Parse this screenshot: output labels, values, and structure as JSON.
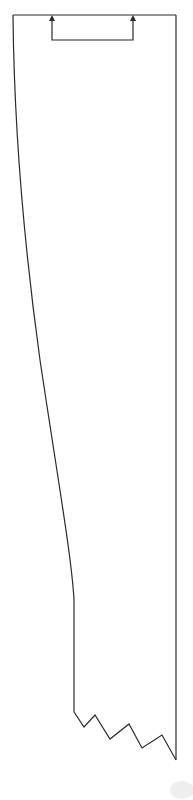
{
  "diagram": {
    "colors": {
      "line": "#2a2a2a",
      "background": "#ffffff",
      "smudge": "#eeeeee"
    },
    "shape": {
      "top_edge": {
        "x1": 13,
        "x2": 176,
        "y": 15
      },
      "right_edge": {
        "x": 176,
        "y1": 15,
        "y2": 760
      },
      "left_edge_curve_points": [
        [
          13,
          15
        ],
        [
          18,
          150
        ],
        [
          30,
          280
        ],
        [
          45,
          390
        ],
        [
          60,
          480
        ],
        [
          70,
          560
        ],
        [
          74,
          590
        ],
        [
          74,
          712
        ]
      ],
      "bottom_jagged_points": [
        [
          74,
          712
        ],
        [
          84,
          727
        ],
        [
          95,
          715
        ],
        [
          110,
          739
        ],
        [
          129,
          724
        ],
        [
          142,
          748
        ],
        [
          162,
          735
        ],
        [
          176,
          760
        ]
      ]
    },
    "bracket": {
      "left_x": 52,
      "right_x": 133,
      "top_y": 15,
      "bottom_y": 40,
      "arrows": [
        "up",
        "up"
      ]
    }
  }
}
